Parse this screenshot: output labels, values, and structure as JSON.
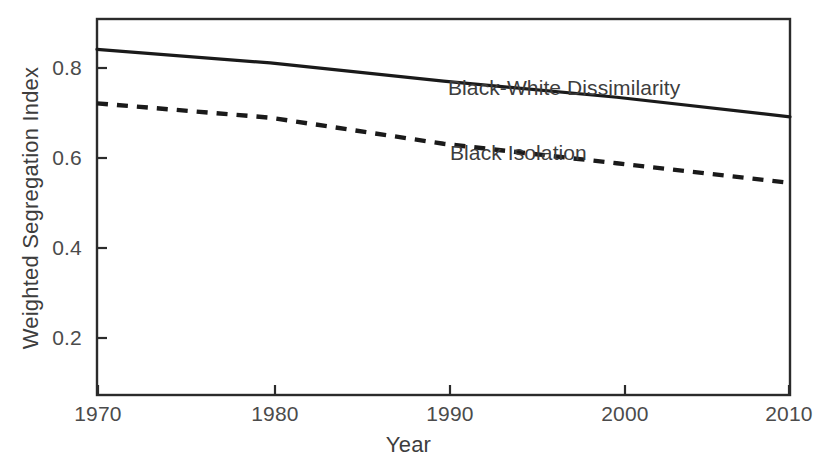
{
  "chart_data": {
    "type": "line",
    "title": "",
    "xlabel": "Year",
    "ylabel": "Weighted Segregation Index",
    "x": [
      1970,
      1980,
      1990,
      2000,
      2010
    ],
    "xlim": [
      1970,
      2010
    ],
    "ylim": [
      0.0,
      0.865
    ],
    "xticks": [
      1970,
      1980,
      1990,
      2000,
      2010
    ],
    "xtick_labels": [
      "1970",
      "1980",
      "1990",
      "2000",
      "2010"
    ],
    "yticks": [
      0.2,
      0.4,
      0.6,
      0.8
    ],
    "ytick_labels": [
      "0.2",
      "0.4",
      "0.6",
      "0.8"
    ],
    "grid": false,
    "legend_position": "inline-annotation",
    "frame": "box",
    "tick_direction": "in",
    "series": [
      {
        "name": "Black-White Dissimilarity",
        "values": [
          0.795,
          0.764,
          0.722,
          0.685,
          0.64
        ],
        "style": "solid",
        "color": "#1a1a1a",
        "width": 3.2,
        "label_x": 1995.6,
        "label_y": 0.79
      },
      {
        "name": "Black Isolation",
        "values": [
          0.671,
          0.638,
          0.578,
          0.533,
          0.488
        ],
        "style": "dashed",
        "color": "#1a1a1a",
        "width": 4.2,
        "label_x": 1990.3,
        "label_y": 0.645
      }
    ]
  },
  "axis": {
    "x_title": "Year",
    "y_title": "Weighted Segregation Index"
  },
  "ticks": {
    "y": [
      "0.8",
      "0.6",
      "0.4",
      "0.2"
    ],
    "x": [
      "1970",
      "1980",
      "1990",
      "2000",
      "2010"
    ]
  },
  "annotations": {
    "dissimilarity": "Black-White Dissimilarity",
    "isolation": "Black Isolation"
  },
  "colors": {
    "line": "#1a1a1a",
    "frame": "#2b2b2b",
    "text": "#3d3d3d",
    "tick_text": "#4b4b4b",
    "background": "#ffffff"
  }
}
